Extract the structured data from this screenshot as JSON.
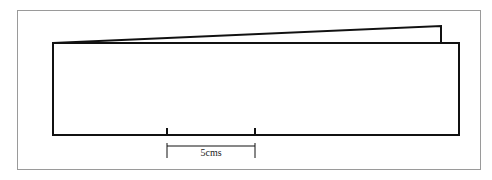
{
  "figure": {
    "frame_color": "#9a9a9a",
    "line_color": "#111111",
    "back_sheet": {
      "points": [
        [
          53,
          43
        ],
        [
          441,
          26
        ],
        [
          441,
          43
        ]
      ]
    },
    "front_sheet": {
      "x": 53,
      "y": 43,
      "width": 406,
      "height": 92
    },
    "scale_bar": {
      "label": "5cms",
      "x_start": 167,
      "x_end": 255,
      "tick_top": 128,
      "baseline": 135,
      "bracket_top": 143,
      "bracket_line": 146,
      "bracket_bottom": 158
    }
  }
}
